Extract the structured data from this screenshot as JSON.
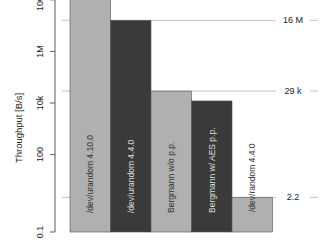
{
  "chart_data": {
    "type": "bar",
    "title": "",
    "xlabel": "",
    "ylabel": "Throughput [B/s]",
    "yscale": "log",
    "ylim": [
      0.1,
      300000000
    ],
    "y_ticks": [
      {
        "value": 100000000,
        "label": "100M"
      },
      {
        "value": 1000000,
        "label": "1M"
      },
      {
        "value": 10000,
        "label": "10k"
      },
      {
        "value": 100,
        "label": "100"
      },
      {
        "value": 0.1,
        "label": "0.1"
      }
    ],
    "grid": false,
    "legend": null,
    "categories": [
      "/dev/urandom 4.10.0",
      "/dev/urandom 4.4.0",
      "Bergmann w/o p.p.",
      "Bergmann w/ AES p.p.",
      "/dev/random 4.4.0"
    ],
    "values": [
      167000000,
      16000000,
      29000,
      12000,
      2.2
    ],
    "bar_colors": [
      "#b0b0b0",
      "#3a3a3a",
      "#b0b0b0",
      "#3a3a3a",
      "#b0b0b0"
    ],
    "label_colors": [
      "#333333",
      "#dddddd",
      "#333333",
      "#dddddd",
      "#333333"
    ],
    "reference_lines": [
      {
        "value": 167000000,
        "label": "167 M"
      },
      {
        "value": 16000000,
        "label": "16 M"
      },
      {
        "value": 29000,
        "label": "29 k"
      },
      {
        "value": 2.2,
        "label": "2.2"
      }
    ]
  }
}
